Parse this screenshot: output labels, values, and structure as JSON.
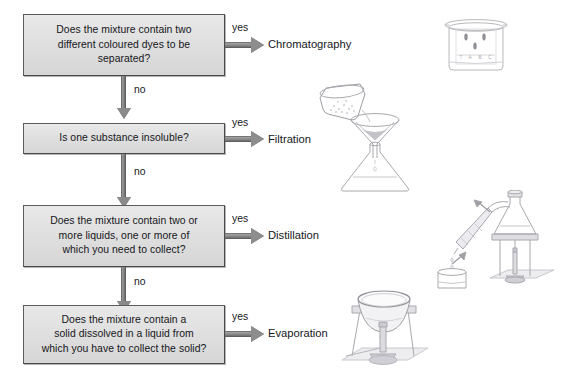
{
  "diagram": {
    "background_color": "#ffffff",
    "box_fill": "#dedede",
    "box_border": "#5c5c5c",
    "arrow_color": "#8a8a8a",
    "text_color": "#15161a"
  },
  "steps": [
    {
      "id": "chromatography",
      "question": "Does the mixture contain two different coloured dyes to be separated?",
      "question_lines": [
        "Does the mixture contain two",
        "different coloured dyes to be",
        "separated?"
      ],
      "yes_label": "yes",
      "no_label": "no",
      "outcome": "Chromatography"
    },
    {
      "id": "filtration",
      "question": "Is one substance insoluble?",
      "question_lines": [
        "Is one substance insoluble?"
      ],
      "yes_label": "yes",
      "no_label": "no",
      "outcome": "Filtration"
    },
    {
      "id": "distillation",
      "question": "Does the mixture contain two or more liquids, one or more of which you need to collect?",
      "question_lines": [
        "Does the mixture contain two or",
        "more liquids, one or more of",
        "which you need to collect?"
      ],
      "yes_label": "yes",
      "no_label": "no",
      "outcome": "Distillation"
    },
    {
      "id": "evaporation",
      "question": "Does the mixture contain a solid dissolved in a liquid from which you have to collect the solid?",
      "question_lines": [
        "Does the mixture contain a",
        "solid dissolved in a liquid from",
        "which you have to collect the solid?"
      ],
      "yes_label": "yes",
      "outcome": "Evaporation"
    }
  ],
  "illustrations": [
    {
      "id": "chromatography-apparatus",
      "name": "beaker-with-chromatography-paper",
      "spot_labels": [
        "T",
        "A",
        "B",
        "C"
      ]
    },
    {
      "id": "filtration-apparatus",
      "name": "beaker-pouring-into-filter-funnel-over-conical-flask"
    },
    {
      "id": "distillation-apparatus",
      "name": "flask-with-condenser-beaker-and-bunsen-burner"
    },
    {
      "id": "evaporation-apparatus",
      "name": "evaporating-basin-on-tripod-over-bunsen-burner"
    }
  ]
}
